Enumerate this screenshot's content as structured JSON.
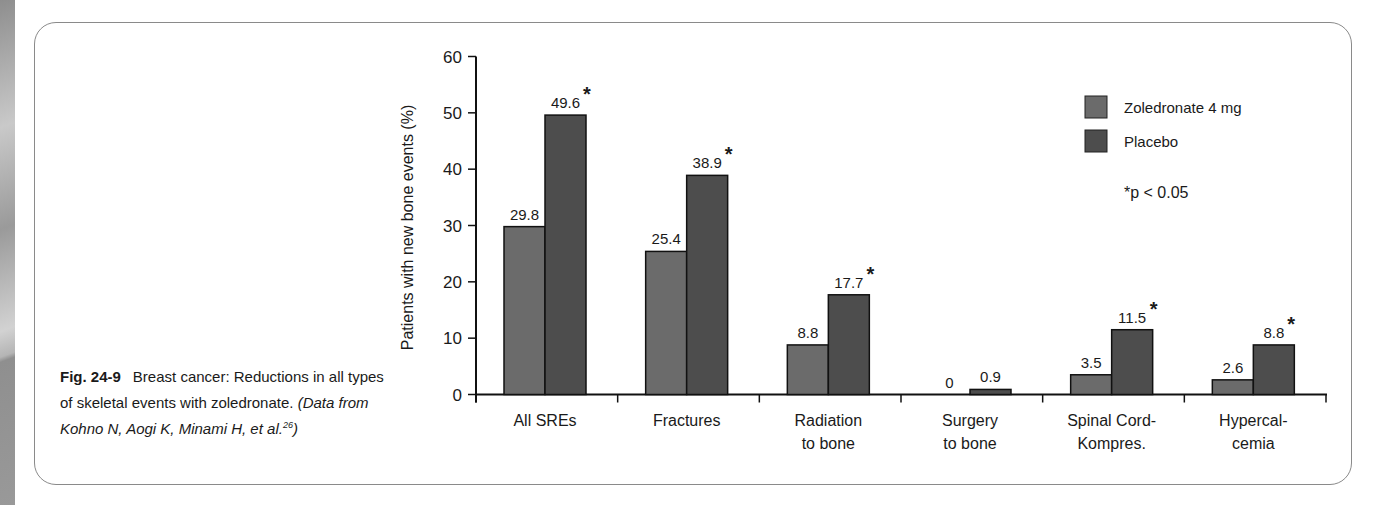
{
  "caption": {
    "figure_label": "Fig. 24-9",
    "text": "Breast cancer: Reductions in all types of skeletal events with zoledronate.",
    "source": "(Data from Kohno N, Aogi K, Minami H, et al.",
    "source_ref": "26",
    "source_close": ")"
  },
  "legend": {
    "items": [
      {
        "label": "Zoledronate 4 mg",
        "color": "#6b6b6b"
      },
      {
        "label": "Placebo",
        "color": "#4d4d4d"
      }
    ],
    "note": "*p < 0.05"
  },
  "chart_data": {
    "type": "bar",
    "title": "",
    "xlabel": "",
    "ylabel": "Patients with new bone events (%)",
    "ylim": [
      0,
      60
    ],
    "yticks": [
      0,
      10,
      20,
      30,
      40,
      50,
      60
    ],
    "grid": false,
    "legend_position": "upper right",
    "categories": [
      [
        "All SREs"
      ],
      [
        "Fractures"
      ],
      [
        "Radiation",
        "to bone"
      ],
      [
        "Surgery",
        "to bone"
      ],
      [
        "Spinal Cord-",
        "Kompres."
      ],
      [
        "Hypercal-",
        "cemia"
      ]
    ],
    "series": [
      {
        "name": "Zoledronate 4 mg",
        "values": [
          29.8,
          25.4,
          8.8,
          0,
          3.5,
          2.6
        ],
        "labels": [
          "29.8",
          "25.4",
          "8.8",
          "0",
          "3.5",
          "2.6"
        ],
        "significant": [
          false,
          false,
          false,
          false,
          false,
          false
        ]
      },
      {
        "name": "Placebo",
        "values": [
          49.6,
          38.9,
          17.7,
          0.9,
          11.5,
          8.8
        ],
        "labels": [
          "49.6",
          "38.9",
          "17.7",
          "0.9",
          "11.5",
          "8.8"
        ],
        "significant": [
          true,
          true,
          true,
          false,
          true,
          true
        ]
      }
    ],
    "significance_marker": "*"
  }
}
